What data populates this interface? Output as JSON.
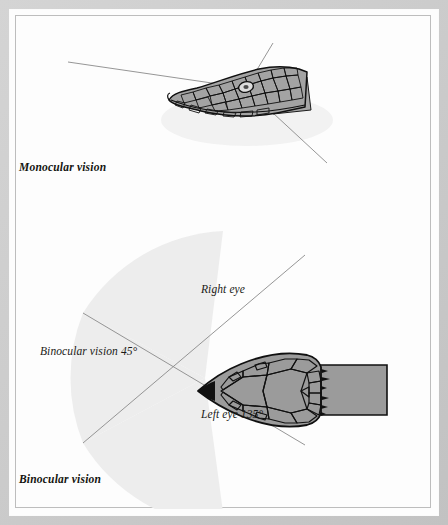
{
  "figure": {
    "panels": [
      {
        "id": "monocular",
        "caption": "Monocular vision",
        "view": "lateral view of snake head",
        "sight_lines": 3,
        "annotations": []
      },
      {
        "id": "binocular",
        "caption": "Binocular vision",
        "view": "dorsal view of snake head",
        "sight_lines": 2,
        "annotations": [
          {
            "id": "right-eye",
            "text": "Right eye"
          },
          {
            "id": "binocular45",
            "text": "Binocular vision 45°"
          },
          {
            "id": "left-eye",
            "text": "Left eye 135°"
          }
        ]
      }
    ]
  },
  "colors": {
    "mat": "#c9c9c9",
    "plate": "#fdfdfd",
    "hairline": "#bdbdbd",
    "cone_fill": "#ededed",
    "sight_line": "#8a8a8a",
    "scale_fill": "#9b9b9b",
    "scale_outline": "#121212",
    "body_fill": "#9b9b9b",
    "text": "#14140f"
  }
}
